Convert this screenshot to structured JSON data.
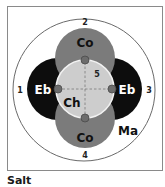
{
  "diagram": {
    "caption": "Salt",
    "colors": {
      "frame": "#8a8a8a",
      "outer_circle": "#6a6a6a",
      "co_fill": "#7b7b7b",
      "eb_fill": "#0d0d0d",
      "center_fill": "#cdcdcd",
      "center_ring": "#f2f2f2",
      "dot_fill": "#6c6c6c",
      "dot_stroke": "#4a4a4a",
      "crosshair": "#7a7a7a"
    },
    "regions": {
      "co_top": "Co",
      "co_bottom": "Co",
      "eb_left": "Eb",
      "eb_right": "Eb",
      "center": "Ch",
      "outer": "Ma"
    },
    "position_numbers": {
      "left": "1",
      "top": "2",
      "right": "3",
      "bottom": "4",
      "center": "5"
    }
  }
}
